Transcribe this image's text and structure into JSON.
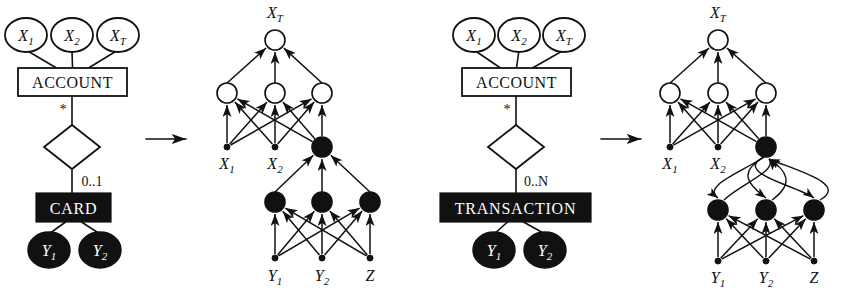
{
  "figure": {
    "name": "er-to-bayesian-network-transformation",
    "background": "#ffffff",
    "ink": "#111111",
    "white_node_fill": "#ffffff",
    "black_node_fill": "#111111",
    "width": 841,
    "height": 303
  },
  "panels": [
    {
      "id": "panel-a",
      "kind": "er-diagram",
      "attributes": [
        {
          "id": "attr-x1",
          "label": "X",
          "sub": "1",
          "cx": 26,
          "cy": 35,
          "rx": 21,
          "ry": 17
        },
        {
          "id": "attr-x2",
          "label": "X",
          "sub": "2",
          "cx": 72,
          "cy": 35,
          "rx": 21,
          "ry": 17
        },
        {
          "id": "attr-xt",
          "label": "X",
          "sub": "T",
          "cx": 118,
          "cy": 35,
          "rx": 21,
          "ry": 17
        }
      ],
      "entity": {
        "id": "entity-account",
        "label": "ACCOUNT",
        "x": 18,
        "y": 68,
        "w": 109,
        "h": 28,
        "filled": false
      },
      "relationship": {
        "id": "relationship-diamond",
        "cx": 72,
        "cy": 147,
        "rx": 28,
        "ry": 22
      },
      "cardinality_top": {
        "id": "cardinality-star",
        "label": "*",
        "x": 63,
        "y": 114
      },
      "cardinality_bottom": {
        "id": "cardinality-range",
        "label": "0..1",
        "x": 78,
        "y": 186
      },
      "child_entity": {
        "id": "entity-card",
        "label": "CARD",
        "x": 36,
        "y": 193,
        "w": 75,
        "h": 29,
        "filled": true
      },
      "child_attributes": [
        {
          "id": "attr-y1",
          "label": "Y",
          "sub": "1",
          "cx": 49,
          "cy": 250,
          "rx": 21,
          "ry": 18
        },
        {
          "id": "attr-y2",
          "label": "Y",
          "sub": "2",
          "cx": 100,
          "cy": 250,
          "rx": 21,
          "ry": 18
        }
      ]
    },
    {
      "id": "panel-b",
      "kind": "bayesian-network",
      "top_label": {
        "text": "X",
        "sub": "T",
        "x": 275,
        "y": 18
      },
      "top_node": {
        "id": "node-xt",
        "cx": 275,
        "cy": 40,
        "r": 10,
        "filled": false
      },
      "hidden_nodes": [
        {
          "id": "node-h1",
          "cx": 227,
          "cy": 93,
          "r": 10,
          "filled": false
        },
        {
          "id": "node-h2",
          "cx": 275,
          "cy": 93,
          "r": 10,
          "filled": false
        },
        {
          "id": "node-h3",
          "cx": 322,
          "cy": 93,
          "r": 10,
          "filled": false
        }
      ],
      "input_nodes": [
        {
          "id": "node-x1",
          "cx": 227,
          "cy": 147,
          "r": 3,
          "filled": true
        },
        {
          "id": "node-x2",
          "cx": 275,
          "cy": 147,
          "r": 3,
          "filled": true
        },
        {
          "id": "node-card",
          "cx": 322,
          "cy": 147,
          "r": 10,
          "filled": true
        }
      ],
      "input_labels": [
        {
          "text": "X",
          "sub": "1",
          "x": 227,
          "y": 169
        },
        {
          "text": "X",
          "sub": "2",
          "x": 275,
          "y": 169
        }
      ],
      "mid_nodes": [
        {
          "id": "node-m1",
          "cx": 275,
          "cy": 202,
          "r": 10,
          "filled": true
        },
        {
          "id": "node-m2",
          "cx": 322,
          "cy": 202,
          "r": 10,
          "filled": true
        },
        {
          "id": "node-m3",
          "cx": 370,
          "cy": 202,
          "r": 10,
          "filled": true
        }
      ],
      "leaf_nodes": [
        {
          "id": "node-y1",
          "cx": 275,
          "cy": 258,
          "r": 3,
          "filled": true
        },
        {
          "id": "node-y2",
          "cx": 322,
          "cy": 258,
          "r": 3,
          "filled": true
        },
        {
          "id": "node-z",
          "cx": 370,
          "cy": 258,
          "r": 3,
          "filled": true
        }
      ],
      "leaf_labels": [
        {
          "text": "Y",
          "sub": "1",
          "x": 275,
          "y": 281
        },
        {
          "text": "Y",
          "sub": "2",
          "x": 322,
          "y": 281
        },
        {
          "text": "Z",
          "sub": "",
          "x": 370,
          "y": 281
        }
      ],
      "curved_feedback": false
    },
    {
      "id": "panel-c",
      "kind": "er-diagram",
      "attributes": [
        {
          "id": "attr-x1",
          "label": "X",
          "sub": "1",
          "cx": 474,
          "cy": 35,
          "rx": 21,
          "ry": 17
        },
        {
          "id": "attr-x2",
          "label": "X",
          "sub": "2",
          "cx": 519,
          "cy": 35,
          "rx": 21,
          "ry": 17
        },
        {
          "id": "attr-xt",
          "label": "X",
          "sub": "T",
          "cx": 564,
          "cy": 35,
          "rx": 21,
          "ry": 17
        }
      ],
      "entity": {
        "id": "entity-account",
        "label": "ACCOUNT",
        "x": 462,
        "y": 68,
        "w": 109,
        "h": 28,
        "filled": false
      },
      "relationship": {
        "id": "relationship-diamond",
        "cx": 516,
        "cy": 147,
        "rx": 28,
        "ry": 22
      },
      "cardinality_top": {
        "id": "cardinality-star",
        "label": "*",
        "x": 507,
        "y": 114
      },
      "cardinality_bottom": {
        "id": "cardinality-range",
        "label": "0..N",
        "x": 522,
        "y": 186
      },
      "child_entity": {
        "id": "entity-transaction",
        "label": "TRANSACTION",
        "x": 440,
        "y": 193,
        "w": 151,
        "h": 29,
        "filled": true
      },
      "child_attributes": [
        {
          "id": "attr-y1",
          "label": "Y",
          "sub": "1",
          "cx": 494,
          "cy": 250,
          "rx": 21,
          "ry": 18
        },
        {
          "id": "attr-y2",
          "label": "Y",
          "sub": "2",
          "cx": 545,
          "cy": 250,
          "rx": 21,
          "ry": 18
        }
      ]
    },
    {
      "id": "panel-d",
      "kind": "bayesian-network",
      "top_label": {
        "text": "X",
        "sub": "T",
        "x": 718,
        "y": 18
      },
      "top_node": {
        "id": "node-xt",
        "cx": 718,
        "cy": 40,
        "r": 10,
        "filled": false
      },
      "hidden_nodes": [
        {
          "id": "node-h1",
          "cx": 670,
          "cy": 93,
          "r": 10,
          "filled": false
        },
        {
          "id": "node-h2",
          "cx": 718,
          "cy": 93,
          "r": 10,
          "filled": false
        },
        {
          "id": "node-h3",
          "cx": 766,
          "cy": 93,
          "r": 10,
          "filled": false
        }
      ],
      "input_nodes": [
        {
          "id": "node-x1",
          "cx": 670,
          "cy": 147,
          "r": 3,
          "filled": true
        },
        {
          "id": "node-x2",
          "cx": 718,
          "cy": 147,
          "r": 3,
          "filled": true
        },
        {
          "id": "node-transaction",
          "cx": 766,
          "cy": 147,
          "r": 10,
          "filled": true
        }
      ],
      "input_labels": [
        {
          "text": "X",
          "sub": "1",
          "x": 670,
          "y": 169
        },
        {
          "text": "X",
          "sub": "2",
          "x": 718,
          "y": 169
        }
      ],
      "mid_nodes": [
        {
          "id": "node-m1",
          "cx": 718,
          "cy": 210,
          "r": 10,
          "filled": true
        },
        {
          "id": "node-m2",
          "cx": 766,
          "cy": 210,
          "r": 10,
          "filled": true
        },
        {
          "id": "node-m3",
          "cx": 814,
          "cy": 210,
          "r": 10,
          "filled": true
        }
      ],
      "leaf_nodes": [
        {
          "id": "node-y1",
          "cx": 718,
          "cy": 261,
          "r": 3,
          "filled": true
        },
        {
          "id": "node-y2",
          "cx": 766,
          "cy": 261,
          "r": 3,
          "filled": true
        },
        {
          "id": "node-z",
          "cx": 814,
          "cy": 261,
          "r": 3,
          "filled": true
        }
      ],
      "leaf_labels": [
        {
          "text": "Y",
          "sub": "1",
          "x": 718,
          "y": 283
        },
        {
          "text": "Y",
          "sub": "2",
          "x": 766,
          "y": 283
        },
        {
          "text": "Z",
          "sub": "",
          "x": 814,
          "y": 283
        }
      ],
      "curved_feedback": true
    }
  ],
  "transition_arrows": [
    {
      "id": "arrow-a-to-b",
      "x1": 146,
      "y1": 139,
      "x2": 186,
      "y2": 139
    },
    {
      "id": "arrow-c-to-d",
      "x1": 601,
      "y1": 139,
      "x2": 641,
      "y2": 139
    }
  ]
}
